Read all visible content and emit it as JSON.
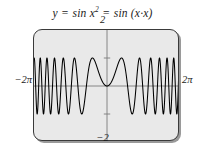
{
  "figure": {
    "title_parts": {
      "lhs": "y",
      "eq1": "=",
      "mid": "sin x",
      "exponent": "2",
      "eq2": "=",
      "rhs": "sin (x·x)"
    },
    "title_plain": "y = sin x² = sin (x·x)",
    "background_color": "#ffffff",
    "plot_fill_color": "#e9e9e9",
    "frame_color": "#3a3a3a",
    "curve_color": "#000000",
    "axis_color": "#7a7a7a"
  },
  "labels": {
    "x_min": "−2π",
    "x_max": "2π",
    "y_max": "2",
    "y_min": "−2"
  },
  "chart_data": {
    "type": "line",
    "xlabel": "",
    "ylabel": "",
    "xlim": [
      -6.283185307179586,
      6.283185307179586
    ],
    "ylim": [
      -2,
      2
    ],
    "xtick_labels": [
      "−2π",
      "2π"
    ],
    "ytick_labels": [
      "2",
      "−2"
    ],
    "y_axis_ticks": [
      -1,
      1
    ],
    "grid": false,
    "legend": null,
    "series": [
      {
        "name": "y = sin(x^2)",
        "expression": "sin(x*x)",
        "amplitude": 1,
        "samples": 4000,
        "description": "Chirp-like oscillation: frequency increases with |x|; slow single arch near x=0, very dense oscillations toward ±2π"
      }
    ]
  }
}
